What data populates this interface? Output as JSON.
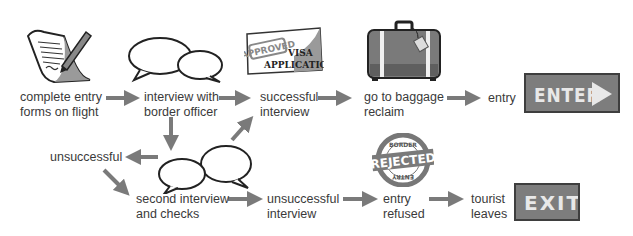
{
  "diagram": {
    "nodes": [
      {
        "id": "forms",
        "label_line1": "complete entry",
        "label_line2": "forms on flight",
        "icon": "document-pen-icon"
      },
      {
        "id": "interview",
        "label_line1": "interview with",
        "label_line2": "border officer",
        "icon": "speech-bubbles-icon"
      },
      {
        "id": "successful",
        "label_line1": "successful",
        "label_line2": "interview",
        "icon": "approved-visa-icon"
      },
      {
        "id": "baggage",
        "label_line1": "go to baggage",
        "label_line2": "reclaim",
        "icon": "suitcase-icon"
      },
      {
        "id": "entry",
        "label_line1": "entry",
        "icon": "enter-sign-icon"
      },
      {
        "id": "unsuccessful1",
        "label_line1": "unsuccessful"
      },
      {
        "id": "second",
        "label_line1": "second interview",
        "label_line2": "and checks",
        "icon": "speech-bubbles-icon"
      },
      {
        "id": "unsuccessful2",
        "label_line1": "unsuccessful",
        "label_line2": "interview"
      },
      {
        "id": "refused",
        "label_line1": "entry",
        "label_line2": "refused",
        "icon": "rejected-stamp-icon"
      },
      {
        "id": "leaves",
        "label_line1": "tourist",
        "label_line2": "leaves",
        "icon": "exit-sign-icon"
      }
    ],
    "edges": [
      [
        "forms",
        "interview"
      ],
      [
        "interview",
        "successful"
      ],
      [
        "successful",
        "baggage"
      ],
      [
        "baggage",
        "entry"
      ],
      [
        "interview",
        "second"
      ],
      [
        "second",
        "unsuccessful1"
      ],
      [
        "second",
        "successful"
      ],
      [
        "unsuccessful1",
        "second"
      ],
      [
        "second",
        "unsuccessful2"
      ],
      [
        "unsuccessful2",
        "refused"
      ],
      [
        "refused",
        "leaves"
      ]
    ],
    "visa": {
      "stamp": "APPROVED",
      "line1": "VISA",
      "line2": "APPLICATION"
    },
    "stamp": {
      "top": "BORDER",
      "middle": "REJECTED",
      "bottom": "ENTRY"
    },
    "enter_sign": "ENTER",
    "exit_sign": "EXIT",
    "colors": {
      "arrow": "#7a7a7a",
      "sign": "#7d7d7d",
      "text": "#3a3a3a"
    }
  }
}
